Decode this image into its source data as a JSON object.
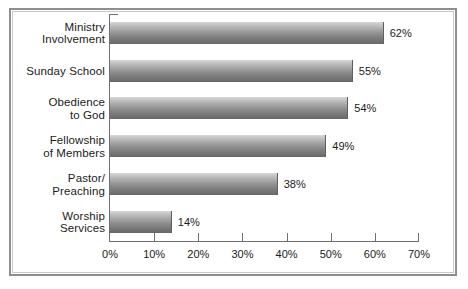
{
  "chart_data": {
    "type": "bar",
    "orientation": "horizontal",
    "title": "",
    "xlabel": "",
    "ylabel": "",
    "xlim": [
      0,
      70
    ],
    "xticks": [
      0,
      10,
      20,
      30,
      40,
      50,
      60,
      70
    ],
    "xtick_labels": [
      "0%",
      "10%",
      "20%",
      "30%",
      "40%",
      "50%",
      "60%",
      "70%"
    ],
    "grid": false,
    "legend": null,
    "categories": [
      "Ministry\nInvolvement",
      "Sunday School",
      "Obedience\nto God",
      "Fellowship\nof Members",
      "Pastor/\nPreaching",
      "Worship\nServices"
    ],
    "values": [
      62,
      55,
      54,
      49,
      38,
      14
    ],
    "value_labels": [
      "62%",
      "55%",
      "54%",
      "49%",
      "38%",
      "14%"
    ],
    "bar_color_top": "#d8d8d8",
    "bar_color_bottom": "#676767",
    "frame_color": "#8e8e8e",
    "axis_color": "#6f6f6f",
    "text_color": "#1b1b1b"
  }
}
